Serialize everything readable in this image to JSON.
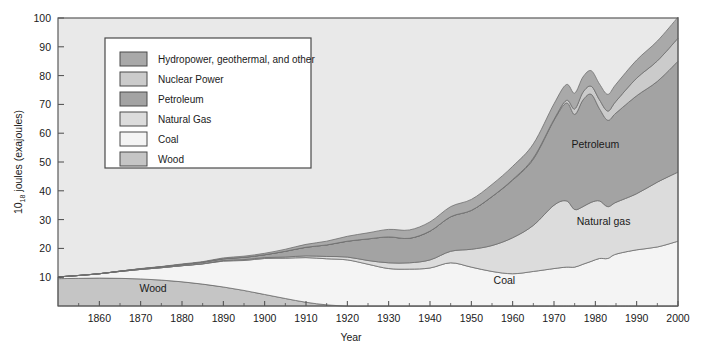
{
  "chart_data": {
    "type": "area",
    "stacked": true,
    "title": "",
    "xlabel": "Year",
    "ylabel": "10₁₈ joules (exajoules)",
    "ylabel_base": "10",
    "ylabel_sub": "18",
    "ylabel_rest": " joules (exajoules)",
    "xlim": [
      1850,
      2000
    ],
    "ylim": [
      0,
      100
    ],
    "grid": false,
    "xticks": [
      1860,
      1870,
      1880,
      1890,
      1900,
      1910,
      1920,
      1930,
      1940,
      1950,
      1960,
      1970,
      1980,
      1990,
      2000
    ],
    "yticks": [
      10,
      20,
      30,
      40,
      50,
      60,
      70,
      80,
      90,
      100
    ],
    "x": [
      1850,
      1855,
      1860,
      1865,
      1870,
      1875,
      1880,
      1885,
      1890,
      1895,
      1900,
      1905,
      1910,
      1915,
      1920,
      1925,
      1930,
      1935,
      1940,
      1945,
      1950,
      1955,
      1960,
      1965,
      1970,
      1973,
      1975,
      1977,
      1979,
      1981,
      1983,
      1985,
      1990,
      1995,
      2000
    ],
    "series": [
      {
        "name": "Wood",
        "color": "#c5c5c5",
        "values": [
          9.5,
          9.6,
          9.7,
          9.6,
          9.4,
          9.0,
          8.4,
          7.6,
          6.6,
          5.4,
          4.0,
          2.6,
          1.3,
          0.4,
          0.0,
          0.0,
          0.0,
          0.0,
          0.0,
          0.0,
          0.0,
          0.0,
          0.0,
          0.0,
          0.0,
          0.0,
          0.0,
          0.0,
          0.0,
          0.0,
          0.0,
          0.0,
          0.0,
          0.0,
          0.0
        ]
      },
      {
        "name": "Coal",
        "color": "#f4f4f4",
        "values": [
          0.6,
          1.0,
          1.5,
          2.4,
          3.3,
          4.3,
          5.6,
          7.0,
          9.0,
          10.4,
          12.5,
          14.0,
          15.5,
          16.0,
          16.0,
          14.5,
          13.0,
          12.8,
          13.2,
          15.0,
          13.5,
          12.0,
          11.2,
          12.0,
          13.0,
          13.5,
          13.5,
          14.5,
          15.5,
          16.5,
          16.5,
          18.0,
          19.5,
          20.5,
          22.5
        ]
      },
      {
        "name": "Natural Gas",
        "color": "#dcdcdc",
        "values": [
          0.0,
          0.0,
          0.0,
          0.0,
          0.0,
          0.0,
          0.0,
          0.1,
          0.2,
          0.3,
          0.3,
          0.4,
          0.6,
          0.8,
          1.0,
          1.3,
          2.0,
          2.2,
          2.8,
          4.0,
          6.2,
          9.0,
          12.5,
          16.0,
          22.0,
          23.0,
          20.0,
          20.0,
          20.5,
          20.0,
          18.0,
          18.0,
          19.5,
          22.5,
          24.0
        ]
      },
      {
        "name": "Petroleum",
        "color": "#a3a3a3",
        "values": [
          0.0,
          0.0,
          0.0,
          0.1,
          0.2,
          0.3,
          0.4,
          0.5,
          0.6,
          0.8,
          1.0,
          2.0,
          3.0,
          4.0,
          5.5,
          7.5,
          9.0,
          8.5,
          10.0,
          12.0,
          13.5,
          17.0,
          20.0,
          23.0,
          29.5,
          34.0,
          33.0,
          37.0,
          37.5,
          32.0,
          30.0,
          31.0,
          34.0,
          35.0,
          38.5
        ]
      },
      {
        "name": "Nuclear Power",
        "color": "#cbcbcb",
        "values": [
          0.0,
          0.0,
          0.0,
          0.0,
          0.0,
          0.0,
          0.0,
          0.0,
          0.0,
          0.0,
          0.0,
          0.0,
          0.0,
          0.0,
          0.0,
          0.0,
          0.0,
          0.0,
          0.0,
          0.0,
          0.0,
          0.0,
          0.2,
          0.4,
          0.3,
          0.9,
          1.9,
          2.7,
          2.8,
          3.1,
          3.2,
          4.1,
          6.1,
          7.1,
          8.0
        ]
      },
      {
        "name": "Hydropower, geothermal, and other",
        "color": "#a9a9a9",
        "values": [
          0.0,
          0.0,
          0.0,
          0.0,
          0.1,
          0.1,
          0.2,
          0.2,
          0.3,
          0.4,
          0.5,
          0.7,
          1.0,
          1.3,
          1.7,
          2.1,
          2.6,
          2.9,
          3.2,
          3.5,
          3.8,
          4.2,
          4.6,
          4.9,
          5.4,
          5.5,
          5.5,
          5.3,
          5.4,
          5.5,
          5.8,
          5.9,
          6.3,
          6.9,
          7.3
        ]
      }
    ],
    "annotations": [
      {
        "text": "Wood",
        "x": 1873,
        "y": 5.0
      },
      {
        "text": "Coal",
        "x": 1958,
        "y": 7.5
      },
      {
        "text": "Natural gas",
        "x": 1982,
        "y": 28.0
      },
      {
        "text": "Petroleum",
        "x": 1980,
        "y": 55.0
      }
    ]
  },
  "legend": {
    "position": "upper-left-inside",
    "items": [
      {
        "label": "Hydropower, geothermal, and other",
        "color": "#a9a9a9"
      },
      {
        "label": "Nuclear Power",
        "color": "#cbcbcb"
      },
      {
        "label": "Petroleum",
        "color": "#a3a3a3"
      },
      {
        "label": "Natural Gas",
        "color": "#dcdcdc"
      },
      {
        "label": "Coal",
        "color": "#f4f4f4"
      },
      {
        "label": "Wood",
        "color": "#c5c5c5"
      }
    ]
  }
}
